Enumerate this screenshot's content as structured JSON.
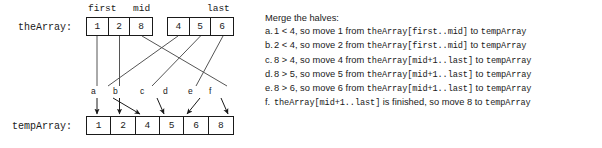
{
  "figure": {
    "arrays": {
      "source": {
        "label": "theArray:",
        "index_labels": [
          {
            "name": "first",
            "cell": 0
          },
          {
            "name": "mid",
            "cell": 2
          },
          {
            "name": "last",
            "cell": 5
          }
        ],
        "groups": [
          {
            "name": "left-half",
            "values": [
              "1",
              "2",
              "8"
            ]
          },
          {
            "name": "right-half",
            "values": [
              "4",
              "5",
              "6"
            ]
          }
        ]
      },
      "target": {
        "label": "tempArray:",
        "values": [
          "1",
          "2",
          "4",
          "5",
          "6",
          "8"
        ]
      }
    },
    "move_labels": [
      "a",
      "b",
      "c",
      "d",
      "e",
      "f"
    ],
    "colors": {
      "line": "#1a1a1a",
      "connector": "#555555",
      "text": "#1a1a1a",
      "background": "#ffffff"
    }
  },
  "explanation": {
    "heading": "Merge the halves:",
    "steps": [
      {
        "bullet": "a.",
        "pre": "1 < 4, so move 1 from ",
        "code1": "theArray[first..mid]",
        "mid": " to ",
        "code2": "tempArray",
        "post": ""
      },
      {
        "bullet": "b.",
        "pre": "2 < 4, so move 2 from ",
        "code1": "theArray[first..mid]",
        "mid": " to ",
        "code2": "tempArray",
        "post": ""
      },
      {
        "bullet": "c.",
        "pre": "8 > 4, so move 4 from ",
        "code1": "theArray[mid+1..last]",
        "mid": " to ",
        "code2": "tempArray",
        "post": ""
      },
      {
        "bullet": "d.",
        "pre": "8 > 5, so move 5 from ",
        "code1": "theArray[mid+1..last]",
        "mid": " to ",
        "code2": "tempArray",
        "post": ""
      },
      {
        "bullet": "e.",
        "pre": "8 > 6, so move 6 from ",
        "code1": "theArray[mid+1..last]",
        "mid": " to ",
        "code2": "tempArray",
        "post": ""
      },
      {
        "bullet": "f.",
        "pre": "",
        "code1": "theArray[mid+1..last]",
        "mid": " is finished, so move 8 to ",
        "code2": "tempArray",
        "post": ""
      }
    ]
  }
}
